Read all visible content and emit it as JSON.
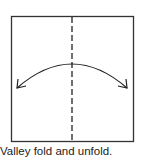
{
  "diagram": {
    "caption": "Valley fold and unfold.",
    "square": {
      "x": 11.5,
      "y": 16.5,
      "w": 122,
      "h": 125
    },
    "fold_line": {
      "type": "valley",
      "style": "dashed",
      "x": 72
    },
    "arrow": {
      "type": "fold-and-unfold",
      "from": [
        17,
        88
      ],
      "peak": [
        72,
        64
      ],
      "to": [
        127,
        88
      ]
    },
    "colors": {
      "line": "#333333",
      "background": "#ffffff"
    }
  }
}
